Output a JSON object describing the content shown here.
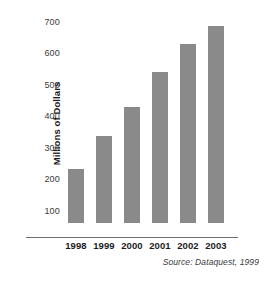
{
  "chart_data": {
    "type": "bar",
    "title": "",
    "subtitle": "",
    "xlabel": "",
    "ylabel": "Millions of Dollars",
    "categories": [
      "1998",
      "1999",
      "2000",
      "2001",
      "2002",
      "2003"
    ],
    "values": [
      180,
      290,
      390,
      505,
      600,
      660
    ],
    "series": [
      {
        "name": "Millions of Dollars",
        "values": [
          180,
          290,
          390,
          505,
          600,
          660
        ]
      }
    ],
    "ylim": [
      0,
      700
    ],
    "yticks": [
      100,
      200,
      300,
      400,
      500,
      600,
      700
    ],
    "ytick_labels": [
      "100",
      "200",
      "300",
      "400",
      "500",
      "600",
      "700"
    ],
    "xtick_labels": [
      "1998",
      "1999",
      "2000",
      "2001",
      "2002",
      "2003"
    ],
    "grid": false,
    "legend": false,
    "legend_position": "none",
    "bar_color": "#8a8a8a",
    "axis_color": "#6f6f6f",
    "background_color": "#ffffff",
    "annotations": [
      {
        "name": "source-note",
        "text": "Source: Dataquest, 1999",
        "position": "bottom-right",
        "style": "italic"
      }
    ]
  },
  "figure": {
    "source_note": "Source: Dataquest, 1999"
  }
}
